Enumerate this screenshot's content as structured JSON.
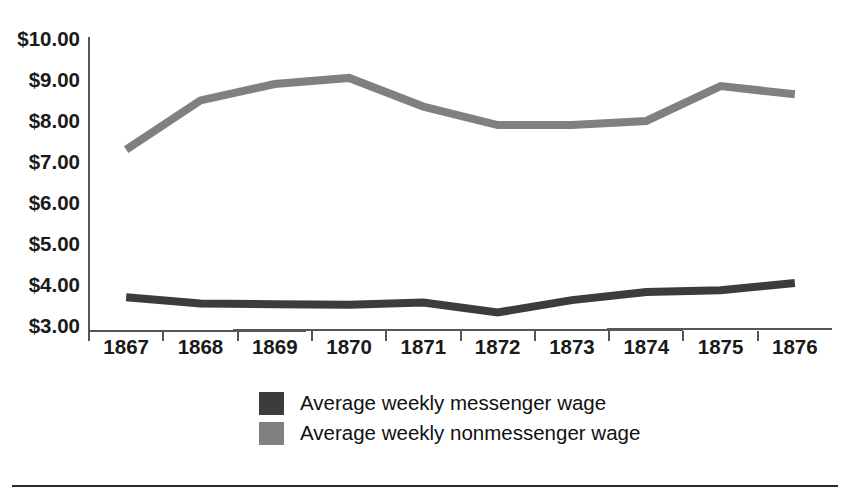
{
  "chart_data": {
    "type": "line",
    "title": "",
    "xlabel": "",
    "ylabel": "",
    "categories": [
      "1867",
      "1868",
      "1869",
      "1870",
      "1871",
      "1872",
      "1873",
      "1874",
      "1875",
      "1876"
    ],
    "series": [
      {
        "name": "Average weekly messenger wage",
        "color": "#3c3c3c",
        "values": [
          3.75,
          3.6,
          3.58,
          3.57,
          3.62,
          3.38,
          3.68,
          3.88,
          3.92,
          4.1
        ]
      },
      {
        "name": "Average weekly nonmessenger wage",
        "color": "#808080",
        "values": [
          7.35,
          8.55,
          8.95,
          9.1,
          8.4,
          7.95,
          7.95,
          8.05,
          8.9,
          8.7
        ]
      }
    ],
    "ylim": [
      3.0,
      10.0
    ],
    "ytick_labels": [
      "$10.00",
      "$9.00",
      "$8.00",
      "$7.00",
      "$6.00",
      "$5.00",
      "$4.00",
      "$3.00"
    ],
    "ytick_values": [
      10,
      9,
      8,
      7,
      6,
      5,
      4,
      3
    ],
    "grid": false,
    "legend_position": "bottom-center"
  },
  "legend": {
    "entries": [
      {
        "label": "Average weekly messenger wage",
        "color": "#3c3c3c",
        "swatch": "legend-swatch-messenger"
      },
      {
        "label": "Average weekly nonmessenger wage",
        "color": "#808080",
        "swatch": "legend-swatch-nonmessenger"
      }
    ]
  }
}
